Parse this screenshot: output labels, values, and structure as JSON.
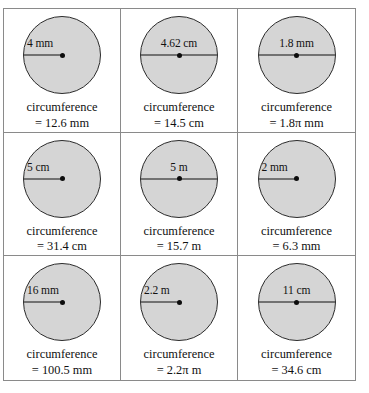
{
  "figure": {
    "rows": 3,
    "columns": 3,
    "circle_fill_color": "#d5d5d5",
    "circle_stroke_color": "#2b2b2b",
    "grid_line_color": "#8a8a8a",
    "background_color": "#ffffff",
    "caption_word": "circumference"
  },
  "cells": [
    {
      "id": "cell-1",
      "row": 1,
      "column": 1,
      "measure_type": "radius",
      "dimension_label": "4 mm",
      "label_align": "left",
      "caption_label": "circumference",
      "caption_value": "= 12.6 mm"
    },
    {
      "id": "cell-2",
      "row": 1,
      "column": 2,
      "measure_type": "diameter",
      "dimension_label": "4.62 cm",
      "label_align": "mid",
      "caption_label": "circumference",
      "caption_value": "= 14.5 cm"
    },
    {
      "id": "cell-3",
      "row": 1,
      "column": 3,
      "measure_type": "diameter",
      "dimension_label": "1.8 mm",
      "label_align": "mid",
      "caption_label": "circumference",
      "caption_value": "= 1.8π mm"
    },
    {
      "id": "cell-4",
      "row": 2,
      "column": 1,
      "measure_type": "radius",
      "dimension_label": "5 cm",
      "label_align": "left",
      "caption_label": "circumference",
      "caption_value": "= 31.4 cm"
    },
    {
      "id": "cell-5",
      "row": 2,
      "column": 2,
      "measure_type": "diameter",
      "dimension_label": "5 m",
      "label_align": "mid",
      "caption_label": "circumference",
      "caption_value": "= 15.7 m"
    },
    {
      "id": "cell-6",
      "row": 2,
      "column": 3,
      "measure_type": "radius",
      "dimension_label": "2 mm",
      "label_align": "left",
      "caption_label": "circumference",
      "caption_value": "= 6.3 mm"
    },
    {
      "id": "cell-7",
      "row": 3,
      "column": 1,
      "measure_type": "radius",
      "dimension_label": "16 mm",
      "label_align": "left",
      "caption_label": "circumference",
      "caption_value": "= 100.5 mm"
    },
    {
      "id": "cell-8",
      "row": 3,
      "column": 2,
      "measure_type": "radius",
      "dimension_label": "2.2 m",
      "label_align": "left",
      "caption_label": "circumference",
      "caption_value": "= 2.2π m"
    },
    {
      "id": "cell-9",
      "row": 3,
      "column": 3,
      "measure_type": "diameter",
      "dimension_label": "11 cm",
      "label_align": "mid",
      "caption_label": "circumference",
      "caption_value": "= 34.6 cm"
    }
  ]
}
